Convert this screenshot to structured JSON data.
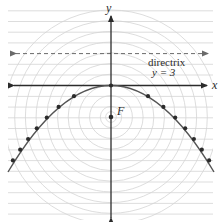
{
  "diagram": {
    "equation_implied": "y = -x^2/12",
    "labels": {
      "x_axis": "x",
      "y_axis": "y",
      "directrix_name": "directrix",
      "directrix_equation": "y = 3",
      "focus": "F"
    },
    "focus": {
      "x": 0,
      "y": -3
    },
    "directrix_y": 3,
    "vertex": {
      "x": 0,
      "y": 0
    },
    "grid": {
      "horizontal_lines_every_unit": true,
      "concentric_circles_centered_at": "F",
      "circle_radii_units": [
        1,
        2,
        3,
        4,
        5,
        6,
        7,
        8,
        9,
        10
      ]
    },
    "marked_points": [
      {
        "x": -9.17,
        "y": -7
      },
      {
        "x": -8.49,
        "y": -6
      },
      {
        "x": -7.75,
        "y": -5
      },
      {
        "x": -6.93,
        "y": -4
      },
      {
        "x": -6.0,
        "y": -3
      },
      {
        "x": -4.9,
        "y": -2
      },
      {
        "x": -3.46,
        "y": -1
      },
      {
        "x": 0,
        "y": 0
      },
      {
        "x": 3.46,
        "y": -1
      },
      {
        "x": 4.9,
        "y": -2
      },
      {
        "x": 6.0,
        "y": -3
      },
      {
        "x": 6.93,
        "y": -4
      },
      {
        "x": 7.75,
        "y": -5
      },
      {
        "x": 8.49,
        "y": -6
      },
      {
        "x": 9.17,
        "y": -7
      }
    ],
    "colors": {
      "axis": "#2b2b2b",
      "curve": "#555555",
      "grid": "#d4d4d4",
      "directrix": "#6a6a6a",
      "points": "#2b2b2b"
    }
  }
}
